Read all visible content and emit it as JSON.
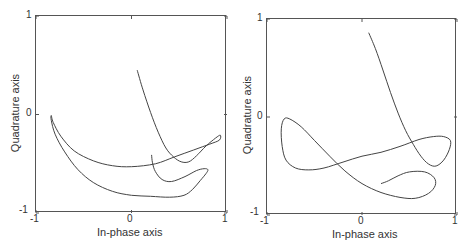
{
  "chart_data": [
    {
      "type": "line",
      "title": "",
      "xlabel": "In-phase axis",
      "ylabel": "Quadrature axis",
      "xlim": [
        -1,
        1
      ],
      "ylim": [
        -1,
        1
      ],
      "xticks": [
        "-1",
        "0",
        "1"
      ],
      "yticks": [
        "1",
        "0",
        "-1"
      ],
      "grid": false,
      "legend": null,
      "series": [
        {
          "name": "trajectory",
          "points": [
            [
              0.06,
              0.45
            ],
            [
              0.12,
              0.25
            ],
            [
              0.2,
              0.02
            ],
            [
              0.28,
              -0.18
            ],
            [
              0.36,
              -0.34
            ],
            [
              0.44,
              -0.43
            ],
            [
              0.52,
              -0.48
            ],
            [
              0.6,
              -0.48
            ],
            [
              0.68,
              -0.42
            ],
            [
              0.78,
              -0.32
            ],
            [
              0.88,
              -0.24
            ],
            [
              0.93,
              -0.21
            ],
            [
              0.92,
              -0.26
            ],
            [
              0.82,
              -0.3
            ],
            [
              0.65,
              -0.36
            ],
            [
              0.45,
              -0.43
            ],
            [
              0.25,
              -0.5
            ],
            [
              0.0,
              -0.53
            ],
            [
              -0.2,
              -0.52
            ],
            [
              -0.4,
              -0.47
            ],
            [
              -0.6,
              -0.37
            ],
            [
              -0.74,
              -0.22
            ],
            [
              -0.82,
              -0.08
            ],
            [
              -0.84,
              -0.01
            ],
            [
              -0.84,
              -0.06
            ],
            [
              -0.8,
              -0.2
            ],
            [
              -0.7,
              -0.38
            ],
            [
              -0.56,
              -0.56
            ],
            [
              -0.4,
              -0.69
            ],
            [
              -0.2,
              -0.78
            ],
            [
              0.0,
              -0.82
            ],
            [
              0.2,
              -0.83
            ],
            [
              0.4,
              -0.84
            ],
            [
              0.55,
              -0.82
            ],
            [
              0.64,
              -0.76
            ],
            [
              0.72,
              -0.67
            ],
            [
              0.78,
              -0.6
            ],
            [
              0.8,
              -0.56
            ],
            [
              0.76,
              -0.55
            ],
            [
              0.68,
              -0.57
            ],
            [
              0.56,
              -0.63
            ],
            [
              0.42,
              -0.68
            ],
            [
              0.32,
              -0.66
            ],
            [
              0.25,
              -0.58
            ],
            [
              0.22,
              -0.49
            ],
            [
              0.21,
              -0.41
            ]
          ]
        }
      ]
    },
    {
      "type": "line",
      "title": "",
      "xlabel": "In-phase axis",
      "ylabel": "Quadrature axis",
      "xlim": [
        -1,
        1
      ],
      "ylim": [
        -1,
        1
      ],
      "xticks": [
        "-1",
        "0",
        "1"
      ],
      "yticks": [
        "1",
        "0",
        "-1"
      ],
      "grid": false,
      "legend": null,
      "series": [
        {
          "name": "trajectory",
          "points": [
            [
              0.07,
              0.86
            ],
            [
              0.14,
              0.7
            ],
            [
              0.22,
              0.48
            ],
            [
              0.3,
              0.25
            ],
            [
              0.38,
              0.04
            ],
            [
              0.46,
              -0.14
            ],
            [
              0.54,
              -0.28
            ],
            [
              0.62,
              -0.4
            ],
            [
              0.7,
              -0.48
            ],
            [
              0.78,
              -0.5
            ],
            [
              0.86,
              -0.44
            ],
            [
              0.92,
              -0.33
            ],
            [
              0.93,
              -0.24
            ],
            [
              0.86,
              -0.2
            ],
            [
              0.75,
              -0.2
            ],
            [
              0.6,
              -0.23
            ],
            [
              0.4,
              -0.3
            ],
            [
              0.2,
              -0.36
            ],
            [
              0.0,
              -0.4
            ],
            [
              -0.2,
              -0.46
            ],
            [
              -0.4,
              -0.52
            ],
            [
              -0.56,
              -0.54
            ],
            [
              -0.7,
              -0.52
            ],
            [
              -0.8,
              -0.44
            ],
            [
              -0.84,
              -0.3
            ],
            [
              -0.85,
              -0.12
            ],
            [
              -0.82,
              -0.02
            ],
            [
              -0.76,
              -0.02
            ],
            [
              -0.64,
              -0.1
            ],
            [
              -0.5,
              -0.24
            ],
            [
              -0.34,
              -0.4
            ],
            [
              -0.18,
              -0.55
            ],
            [
              0.0,
              -0.68
            ],
            [
              0.2,
              -0.77
            ],
            [
              0.4,
              -0.82
            ],
            [
              0.56,
              -0.83
            ],
            [
              0.7,
              -0.78
            ],
            [
              0.77,
              -0.7
            ],
            [
              0.76,
              -0.62
            ],
            [
              0.66,
              -0.56
            ],
            [
              0.5,
              -0.56
            ],
            [
              0.38,
              -0.6
            ],
            [
              0.28,
              -0.65
            ],
            [
              0.2,
              -0.68
            ]
          ]
        }
      ]
    }
  ],
  "panels": [
    {
      "ticks": {
        "y_top": "1",
        "y_mid": "0",
        "y_bottom": "-1",
        "x_left": "-1",
        "x_mid": "0",
        "x_right": "1"
      },
      "xlabel": "In-phase axis",
      "ylabel": "Quadrature axis"
    },
    {
      "ticks": {
        "y_top": "1",
        "y_mid": "0",
        "y_bottom": "-1",
        "x_left": "-1",
        "x_mid": "0",
        "x_right": "1"
      },
      "xlabel": "In-phase axis",
      "ylabel": "Quadrature axis"
    }
  ],
  "style": {
    "line_color": "#444444",
    "frame_color": "#555555"
  }
}
